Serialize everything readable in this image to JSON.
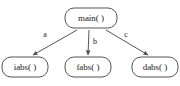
{
  "diagram": {
    "type": "call-graph",
    "title": "",
    "colors": {
      "background": "#ffffff",
      "node_stroke": "#555555",
      "node_fill": "#ffffff",
      "edge_stroke": "#555555",
      "text": "#222222"
    },
    "nodes": [
      {
        "id": "main",
        "label": "main( )",
        "x": 91,
        "y": 18,
        "w": 52,
        "h": 20,
        "role": "caller"
      },
      {
        "id": "iabs",
        "label": "iabs( )",
        "x": 25,
        "y": 67,
        "w": 46,
        "h": 20,
        "role": "callee"
      },
      {
        "id": "fabs",
        "label": "fabs( )",
        "x": 88,
        "y": 67,
        "w": 46,
        "h": 20,
        "role": "callee"
      },
      {
        "id": "dabs",
        "label": "dabs( )",
        "x": 155,
        "y": 67,
        "w": 46,
        "h": 20,
        "role": "callee"
      }
    ],
    "edges": [
      {
        "id": "edge-a",
        "from": "main",
        "to": "iabs",
        "label": "a",
        "x1": 77,
        "y1": 30,
        "x2": 33,
        "y2": 55,
        "lx": 45,
        "ly": 35
      },
      {
        "id": "edge-b",
        "from": "main",
        "to": "fabs",
        "label": "b",
        "x1": 89,
        "y1": 30,
        "x2": 88,
        "y2": 55,
        "lx": 95,
        "ly": 42
      },
      {
        "id": "edge-c",
        "from": "main",
        "to": "dabs",
        "label": "c",
        "x1": 106,
        "y1": 30,
        "x2": 148,
        "y2": 55,
        "lx": 126,
        "ly": 35
      }
    ]
  }
}
